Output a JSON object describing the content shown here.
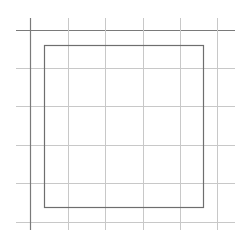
{
  "diagram": {
    "type": "grid-with-inner-rectangle",
    "size": {
      "width": 247,
      "height": 248
    },
    "grid": {
      "vertical_lines_x": [
        30,
        68,
        105,
        143,
        180,
        217
      ],
      "vertical_span_y": [
        18,
        230
      ],
      "horizontal_lines_y": [
        30,
        68,
        106,
        145,
        183,
        222
      ],
      "horizontal_span_x": [
        16,
        235
      ],
      "line_color": "#c8c8c8",
      "emphasis_line_color": "#7a7a7a",
      "emphasized_vertical_index": 0,
      "emphasized_horizontal_index": 0
    },
    "inner_rectangle": {
      "x": 44,
      "y": 45,
      "width": 159,
      "height": 162,
      "stroke": "#6e6e6e",
      "stroke_width": 1.2
    },
    "background": "#ffffff"
  }
}
